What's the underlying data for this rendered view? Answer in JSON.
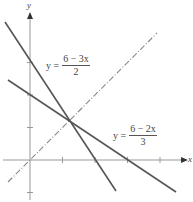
{
  "axes": {
    "x_label": "x",
    "y_label": "y",
    "origin_px": [
      30,
      160
    ],
    "unit_px": 32.5,
    "x_ticks": [
      1,
      2,
      3,
      4
    ],
    "y_ticks": [
      -1,
      1,
      2,
      3
    ]
  },
  "lines": [
    {
      "id": "line1",
      "label_lhs": "y =",
      "label_num": "6 − 3x",
      "label_den": "2",
      "style": "solid",
      "color": "#555555"
    },
    {
      "id": "line2",
      "label_lhs": "y =",
      "label_num": "6 − 2x",
      "label_den": "3",
      "style": "solid",
      "color": "#555555"
    },
    {
      "id": "line3",
      "label": "y = x",
      "style": "dash-dot",
      "color": "#888888"
    }
  ],
  "intersection": {
    "x": 1.2,
    "y": 1.2
  }
}
